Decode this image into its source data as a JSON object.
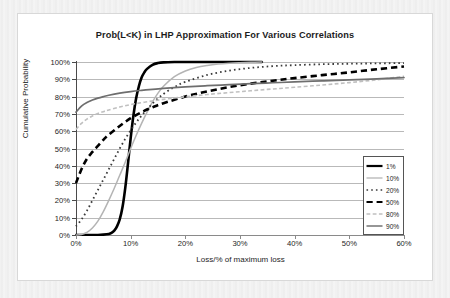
{
  "chart_data": {
    "type": "line",
    "title": "Prob(L<K) in LHP Approximation For Various Correlations",
    "xlabel": "Loss/% of maximum loss",
    "ylabel": "Cumulative Probability",
    "xlim": [
      0,
      60
    ],
    "ylim": [
      0,
      100
    ],
    "xticks": [
      "0%",
      "10%",
      "20%",
      "30%",
      "40%",
      "50%",
      "60%"
    ],
    "xtick_values": [
      0,
      10,
      20,
      30,
      40,
      50,
      60
    ],
    "yticks": [
      "0%",
      "10%",
      "20%",
      "30%",
      "40%",
      "50%",
      "60%",
      "70%",
      "80%",
      "90%",
      "100%"
    ],
    "ytick_values": [
      0,
      10,
      20,
      30,
      40,
      50,
      60,
      70,
      80,
      90,
      100
    ],
    "grid": "horizontal",
    "legend_position": "lower-right-inside",
    "series": [
      {
        "name": "1%",
        "style": "solid",
        "color": "#000000",
        "width": 2.6,
        "x": [
          0,
          1,
          2,
          3,
          4,
          5,
          6,
          6.5,
          7,
          7.5,
          8,
          8.5,
          9,
          9.5,
          10,
          10.5,
          11,
          11.5,
          12,
          12.5,
          13,
          14,
          15,
          16,
          18,
          20,
          24,
          28,
          32,
          34
        ],
        "y": [
          0,
          0,
          0,
          0,
          0,
          0.2,
          0.6,
          1.2,
          2.5,
          5,
          9,
          16,
          27,
          41,
          56,
          69,
          79,
          86,
          91,
          94,
          96,
          98.4,
          99.4,
          99.8,
          100,
          100,
          100,
          100,
          100,
          100
        ]
      },
      {
        "name": "10%",
        "style": "solid",
        "color": "#b4b4b4",
        "width": 1.5,
        "x": [
          0,
          1,
          2,
          3,
          4,
          5,
          6,
          7,
          8,
          9,
          10,
          11,
          12,
          13,
          14,
          15,
          16,
          18,
          20,
          22,
          24,
          26,
          28,
          30,
          32,
          34
        ],
        "y": [
          0,
          0.3,
          1.5,
          4,
          8,
          13.5,
          20,
          27,
          34.5,
          42,
          50,
          57.5,
          64.5,
          71,
          77,
          82,
          86,
          91.5,
          94.8,
          96.8,
          98,
          98.8,
          99.3,
          99.6,
          99.8,
          100
        ]
      },
      {
        "name": "20%",
        "style": "dotted",
        "color": "#3a3a3a",
        "width": 1.8,
        "x": [
          0,
          1,
          2,
          3,
          4,
          5,
          6,
          7,
          8,
          9,
          10,
          11,
          12,
          14,
          16,
          18,
          20,
          24,
          28,
          32,
          36,
          40,
          45,
          50,
          55,
          60
        ],
        "y": [
          5,
          9,
          14,
          20,
          26,
          32,
          38,
          44,
          50,
          55.5,
          60.5,
          65,
          69,
          76,
          81.5,
          85.5,
          88.5,
          92.5,
          95,
          96.6,
          97.6,
          98.2,
          98.7,
          99,
          99.2,
          99.4
        ]
      },
      {
        "name": "50%",
        "style": "dashed",
        "color": "#000000",
        "width": 2.6,
        "x": [
          0,
          1,
          2,
          3,
          4,
          5,
          6,
          8,
          10,
          12,
          14,
          16,
          20,
          24,
          28,
          32,
          36,
          40,
          45,
          50,
          55,
          60
        ],
        "y": [
          30,
          38,
          44,
          48,
          51.5,
          55,
          58,
          63,
          67.5,
          71,
          73.8,
          76.2,
          80,
          83,
          85.5,
          87.5,
          89.2,
          90.7,
          92.4,
          94,
          95.8,
          97.4
        ]
      },
      {
        "name": "80%",
        "style": "dashed",
        "color": "#c0c0c0",
        "width": 1.6,
        "x": [
          0,
          1,
          2,
          3,
          4,
          5,
          6,
          8,
          10,
          12,
          14,
          16,
          20,
          24,
          28,
          32,
          36,
          40,
          45,
          50,
          55,
          60
        ],
        "y": [
          61,
          64.5,
          67,
          68.8,
          70.2,
          71.3,
          72.3,
          74,
          75.4,
          76.5,
          77.5,
          78.4,
          79.9,
          81.2,
          82.3,
          83.4,
          84.4,
          85.4,
          86.7,
          88.1,
          89.7,
          91.8
        ]
      },
      {
        "name": "90%",
        "style": "solid",
        "color": "#6e6e6e",
        "width": 1.7,
        "x": [
          0,
          1,
          2,
          3,
          4,
          5,
          6,
          8,
          10,
          12,
          14,
          16,
          20,
          24,
          28,
          32,
          36,
          40,
          45,
          50,
          55,
          60
        ],
        "y": [
          71,
          74.5,
          76.6,
          78,
          79.1,
          80,
          80.8,
          82,
          82.9,
          83.6,
          84.2,
          84.7,
          85.6,
          86.3,
          86.9,
          87.5,
          88,
          88.5,
          89.1,
          89.7,
          90.3,
          91
        ]
      }
    ]
  },
  "legend": {
    "items": [
      {
        "label": "1%"
      },
      {
        "label": "10%"
      },
      {
        "label": "20%"
      },
      {
        "label": "50%"
      },
      {
        "label": "80%"
      },
      {
        "label": "90%"
      }
    ]
  }
}
